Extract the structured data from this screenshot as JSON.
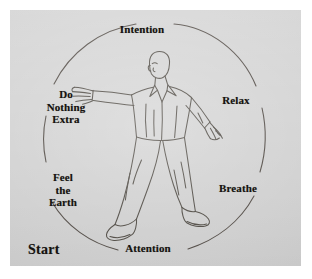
{
  "diagram": {
    "background_color": "#d2d2d2",
    "ink_color": "#3a3430",
    "text_color": "#15120f",
    "circle": {
      "center_x": 146,
      "center_y": 128,
      "radius_x": 110,
      "radius_y": 116
    },
    "labels": [
      {
        "id": "intention",
        "text": "Intention",
        "position": "top"
      },
      {
        "id": "relax",
        "text": "Relax",
        "position": "right-upper"
      },
      {
        "id": "breathe",
        "text": "Breathe",
        "position": "right-lower"
      },
      {
        "id": "attention",
        "text": "Attention",
        "position": "bottom"
      },
      {
        "id": "feel-the-earth",
        "text": "Feel\nthe\nEarth",
        "position": "left-lower"
      },
      {
        "id": "do-nothing-extra",
        "text": "Do\nNothing\nExtra",
        "position": "left-upper"
      }
    ],
    "label_intention": "Intention",
    "label_relax": "Relax",
    "label_breathe": "Breathe",
    "label_attention": "Attention",
    "label_feel": "Feel",
    "label_the": "the",
    "label_earth": "Earth",
    "label_do": "Do",
    "label_nothing": "Nothing",
    "label_extra": "Extra",
    "label_start": "Start"
  }
}
